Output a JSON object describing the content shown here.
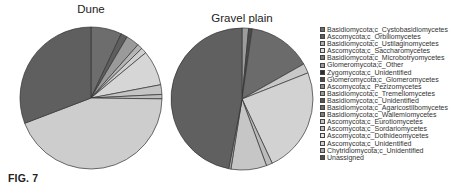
{
  "figure_label": "FIG. 7",
  "chart_data": [
    {
      "type": "pie",
      "title": "Dune",
      "categories": [
        "Basidiomycota;c_Cystobasidiomycetes",
        "Ascomycota;c_Orbiliomycetes",
        "Basidiomycota;c_Ustilaginomycetes",
        "Ascomycota;c_Saccharomycetes",
        "Basidiomycota;c_Microbotryomycetes",
        "Glomeromycota;c_Other",
        "Ascomycota;c_Pezizomycetes",
        "Basidiomycota;c_Unidentified",
        "Ascomycota;c_Unidentified",
        "Unassigned"
      ],
      "values": [
        7,
        1.5,
        3,
        1.2,
        1.3,
        8,
        2.2,
        1,
        44,
        30.8
      ],
      "colors": [
        "#6d6d6d",
        "#5e5e5e",
        "#9a9a9a",
        "#b5b5b5",
        "#cfcfcf",
        "#d6d6d6",
        "#c4c4c4",
        "#bdbdbd",
        "#cdcdcd",
        "#5f5f5f"
      ]
    },
    {
      "type": "pie",
      "title": "Gravel plain",
      "categories": [
        "Basidiomycota;c_Tremellomycetes",
        "Glomeromycota;c_Glomeromycetes",
        "Basidiomycota;c_Cystobasidiomycetes",
        "Ascomycota;c_Saccharomycetes",
        "Ascomycota;c_Dothideomycetes",
        "Ascomycota;c_Sordariomycetes",
        "Ascomycota;c_Eurotiomycetes",
        "Chytridiomycota;c_Unidentified",
        "Unassigned"
      ],
      "values": [
        1.5,
        0.8,
        14.5,
        2.2,
        24,
        1.4,
        8.1,
        0.5,
        47
      ],
      "colors": [
        "#9c9c9c",
        "#4a4a4a",
        "#6b6b6b",
        "#c8c8c8",
        "#d2d2d2",
        "#bbbbbb",
        "#c6c6c6",
        "#a8a8a8",
        "#606060"
      ]
    }
  ],
  "legend": [
    {
      "label": "Basidiomycota;c_Cystobasidiomycetes",
      "color": "#6d6d6d"
    },
    {
      "label": "Ascomycota;c_Orbiliomycetes",
      "color": "#5e5e5e"
    },
    {
      "label": "Basidiomycota;c_Ustilaginomycetes",
      "color": "#b0b0b0"
    },
    {
      "label": "Ascomycota;c_Saccharomycetes",
      "color": "#e0e0e0"
    },
    {
      "label": "Basidiomycota;c_Microbotryomycetes",
      "color": "#7a7a7a"
    },
    {
      "label": "Glomeromycota;c_Other",
      "color": "#9a9a9a"
    },
    {
      "label": "Zygomycota;c_Unidentified",
      "color": "#2e2e2e"
    },
    {
      "label": "Glomeromycota;c_Glomeromycetes",
      "color": "#4a4a4a"
    },
    {
      "label": "Ascomycota;c_Pezizomycetes",
      "color": "#8a8a8a"
    },
    {
      "label": "Basidiomycota;c_Tremellomycetes",
      "color": "#9c9c9c"
    },
    {
      "label": "Basidiomycota;c_Unidentified",
      "color": "#555555"
    },
    {
      "label": "Basidiomycota;c_Agaricostilbomycetes",
      "color": "#6a6a6a"
    },
    {
      "label": "Basidiomycota;c_Wallemiomycetes",
      "color": "#7f7f7f"
    },
    {
      "label": "Ascomycota;c_Eurotiomycetes",
      "color": "#c6c6c6"
    },
    {
      "label": "Ascomycota;c_Sordariomycetes",
      "color": "#bbbbbb"
    },
    {
      "label": "Ascomycota;c_Dothideomycetes",
      "color": "#e4e4e4"
    },
    {
      "label": "Ascomycota;c_Unidentified",
      "color": "#d0d0d0"
    },
    {
      "label": "Chytridiomycota;c_Unidentified",
      "color": "#a8a8a8"
    },
    {
      "label": "Unassigned",
      "color": "#4f4f4f"
    }
  ]
}
